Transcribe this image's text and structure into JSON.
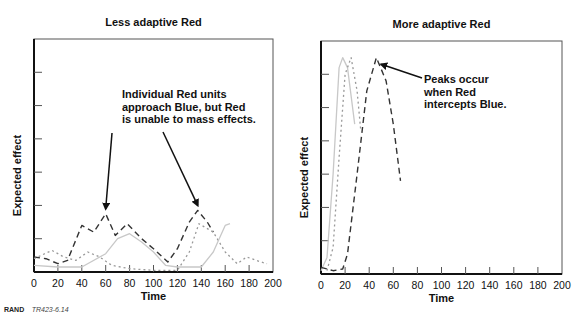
{
  "credit": {
    "org": "RAND",
    "id": "TR423-6.14"
  },
  "chart_data": [
    {
      "type": "line",
      "title": "Less adaptive Red",
      "xlabel": "Time",
      "ylabel": "Expected effect",
      "xlim": [
        0,
        200
      ],
      "ylim": [
        0,
        7
      ],
      "xticks": [
        0,
        20,
        40,
        60,
        80,
        100,
        120,
        140,
        160,
        180,
        200
      ],
      "xtick_labels": [
        "0",
        "20",
        "40",
        "60",
        "80",
        "100",
        "120",
        "140",
        "160",
        "180",
        "200"
      ],
      "yticks_labeled": false,
      "grid": false,
      "series": [
        {
          "name": "dashed",
          "style": "dashed",
          "color": "#333333",
          "x": [
            0,
            10,
            20,
            28,
            40,
            50,
            60,
            68,
            78,
            90,
            100,
            112,
            120,
            130,
            137,
            145,
            150
          ],
          "y": [
            0.45,
            0.4,
            0.25,
            0.35,
            1.4,
            1.2,
            1.75,
            1.1,
            1.45,
            1.0,
            0.7,
            0.3,
            0.7,
            1.5,
            1.85,
            1.5,
            1.2
          ]
        },
        {
          "name": "dotted",
          "style": "dotted",
          "color": "#999999",
          "x": [
            0,
            15,
            25,
            35,
            45,
            55,
            65,
            80,
            100,
            120,
            130,
            138,
            150,
            160,
            170,
            178,
            190,
            195
          ],
          "y": [
            0.4,
            0.65,
            0.45,
            0.35,
            0.6,
            0.45,
            0.2,
            0.1,
            0.05,
            0.05,
            0.6,
            1.45,
            1.2,
            0.6,
            0.25,
            0.45,
            0.3,
            0.25
          ]
        },
        {
          "name": "solid",
          "style": "solid",
          "color": "#c8c8c8",
          "x": [
            0,
            20,
            40,
            60,
            70,
            80,
            90,
            100,
            110,
            120,
            140,
            150,
            155,
            160,
            164
          ],
          "y": [
            0.2,
            0.15,
            0.15,
            0.55,
            1.0,
            1.15,
            0.9,
            0.6,
            0.2,
            0.15,
            0.15,
            0.6,
            1.0,
            1.4,
            1.45
          ]
        }
      ],
      "annotations": [
        {
          "lines": [
            "Individual Red units",
            "approach Blue, but Red",
            "is unable to mass effects."
          ],
          "arrows_to": [
            [
              60,
              1.9
            ],
            [
              137,
              2.0
            ]
          ]
        }
      ]
    },
    {
      "type": "line",
      "title": "More adaptive Red",
      "xlabel": "Time",
      "ylabel": "Expected effect",
      "xlim": [
        0,
        200
      ],
      "ylim": [
        0,
        7
      ],
      "xticks": [
        0,
        20,
        40,
        60,
        80,
        100,
        120,
        140,
        160,
        180,
        200
      ],
      "xtick_labels": [
        "0",
        "20",
        "40",
        "60",
        "80",
        "100",
        "120",
        "140",
        "160",
        "180",
        "200"
      ],
      "yticks_labeled": false,
      "grid": false,
      "series": [
        {
          "name": "solid",
          "style": "solid",
          "color": "#c8c8c8",
          "x": [
            0,
            5,
            10,
            15,
            18,
            22,
            28
          ],
          "y": [
            0.1,
            0.5,
            3.0,
            6.2,
            6.5,
            6.2,
            4.5
          ]
        },
        {
          "name": "dotted",
          "style": "dotted",
          "color": "#999999",
          "x": [
            5,
            10,
            15,
            20,
            25,
            30,
            33
          ],
          "y": [
            0.1,
            0.8,
            3.5,
            6.0,
            6.5,
            5.5,
            4.3
          ]
        },
        {
          "name": "dashed",
          "style": "dashed",
          "color": "#333333",
          "x": [
            0,
            10,
            18,
            22,
            30,
            38,
            46,
            54,
            60,
            66
          ],
          "y": [
            0.2,
            0.1,
            0.15,
            0.6,
            3.0,
            5.5,
            6.5,
            5.8,
            4.5,
            2.8
          ]
        }
      ],
      "annotations": [
        {
          "lines": [
            "Peaks occur",
            "when Red",
            "intercepts Blue."
          ],
          "arrows_to": [
            [
              50,
              6.3
            ]
          ]
        }
      ]
    }
  ]
}
